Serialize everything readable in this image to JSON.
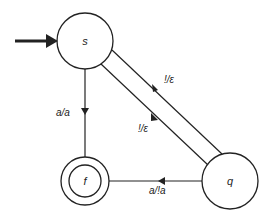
{
  "diagram": {
    "type": "pushdown-automaton",
    "colors": {
      "stroke": "#222222",
      "background": "#ffffff"
    },
    "states": [
      {
        "id": "s",
        "label": "s",
        "start": true,
        "accepting": false
      },
      {
        "id": "f",
        "label": "f",
        "start": false,
        "accepting": true
      },
      {
        "id": "q",
        "label": "q",
        "start": false,
        "accepting": false
      }
    ],
    "transitions": [
      {
        "from": "s",
        "to": "f",
        "label": "a/a"
      },
      {
        "from": "s",
        "to": "q",
        "label": "!/ε"
      },
      {
        "from": "q",
        "to": "s",
        "label": "!/ε"
      },
      {
        "from": "q",
        "to": "f",
        "label": "a/!a"
      }
    ]
  }
}
